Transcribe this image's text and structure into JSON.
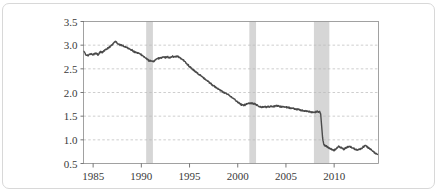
{
  "figure": {
    "border_color": "#d8d8d8",
    "background": "#ffffff"
  },
  "chart_data": {
    "type": "line",
    "title": "",
    "subtitle": "",
    "xlabel": "",
    "ylabel": "",
    "xlim": [
      1984.0,
      1984.0
    ],
    "ylim": [
      0.5,
      3.5
    ],
    "grid": true,
    "grid_style": "dashed-horizontal",
    "grid_color": "#b9b9b9",
    "legend": null,
    "line_color": "#4a4a4a",
    "line_width": 1.4,
    "axis_color": "#555555",
    "xticks": [
      1985,
      1990,
      1995,
      2000,
      2005,
      2010
    ],
    "xticklabels": [
      "1985",
      "1990",
      "1995",
      "2000",
      "2005",
      "2010"
    ],
    "yticks": [
      0.5,
      1.0,
      1.5,
      2.0,
      2.5,
      3.0,
      3.5
    ],
    "yticklabels": [
      "0.5",
      "1.0",
      "1.5",
      "2.0",
      "2.5",
      "3.0",
      "3.5"
    ],
    "x_axis_range": [
      1984.0,
      2014.6
    ],
    "shaded_regions": [
      {
        "name": "recession-1990",
        "x0": 1990.5,
        "x1": 1991.2,
        "color": "#d6d6d6"
      },
      {
        "name": "recession-2001",
        "x0": 2001.2,
        "x1": 2001.9,
        "color": "#d6d6d6"
      },
      {
        "name": "recession-2008",
        "x0": 2007.9,
        "x1": 2009.5,
        "color": "#d6d6d6"
      }
    ],
    "x": [
      1984.0,
      1984.25,
      1984.5,
      1984.75,
      1985.0,
      1985.25,
      1985.5,
      1985.75,
      1986.0,
      1986.25,
      1986.5,
      1986.75,
      1987.0,
      1987.25,
      1987.5,
      1987.75,
      1988.0,
      1988.25,
      1988.5,
      1988.75,
      1989.0,
      1989.25,
      1989.5,
      1989.75,
      1990.0,
      1990.25,
      1990.5,
      1990.75,
      1991.0,
      1991.25,
      1991.5,
      1991.75,
      1992.0,
      1992.25,
      1992.5,
      1992.75,
      1993.0,
      1993.25,
      1993.5,
      1993.75,
      1994.0,
      1994.25,
      1994.5,
      1994.75,
      1995.0,
      1995.25,
      1995.5,
      1995.75,
      1996.0,
      1996.25,
      1996.5,
      1996.75,
      1997.0,
      1997.25,
      1997.5,
      1997.75,
      1998.0,
      1998.25,
      1998.5,
      1998.75,
      1999.0,
      1999.25,
      1999.5,
      1999.75,
      2000.0,
      2000.25,
      2000.5,
      2000.75,
      2001.0,
      2001.25,
      2001.5,
      2001.75,
      2002.0,
      2002.25,
      2002.5,
      2002.75,
      2003.0,
      2003.25,
      2003.5,
      2003.75,
      2004.0,
      2004.25,
      2004.5,
      2004.75,
      2005.0,
      2005.25,
      2005.5,
      2005.75,
      2006.0,
      2006.25,
      2006.5,
      2006.75,
      2007.0,
      2007.25,
      2007.5,
      2007.75,
      2008.0,
      2008.25,
      2008.5,
      2008.6,
      2008.7,
      2008.8,
      2008.9,
      2009.0,
      2009.25,
      2009.5,
      2009.75,
      2010.0,
      2010.25,
      2010.5,
      2010.75,
      2011.0,
      2011.25,
      2011.5,
      2011.75,
      2012.0,
      2012.25,
      2012.5,
      2012.75,
      2013.0,
      2013.25,
      2013.5,
      2013.75,
      2014.0,
      2014.25,
      2014.5
    ],
    "y": [
      2.88,
      2.8,
      2.78,
      2.82,
      2.8,
      2.83,
      2.8,
      2.86,
      2.85,
      2.9,
      2.93,
      2.97,
      3.02,
      3.08,
      3.05,
      3.0,
      3.0,
      2.97,
      2.95,
      2.92,
      2.9,
      2.86,
      2.84,
      2.82,
      2.8,
      2.76,
      2.72,
      2.68,
      2.66,
      2.66,
      2.69,
      2.72,
      2.73,
      2.75,
      2.74,
      2.75,
      2.74,
      2.76,
      2.75,
      2.76,
      2.74,
      2.7,
      2.65,
      2.6,
      2.55,
      2.5,
      2.46,
      2.42,
      2.38,
      2.34,
      2.3,
      2.26,
      2.22,
      2.18,
      2.14,
      2.1,
      2.07,
      2.04,
      2.01,
      1.99,
      1.96,
      1.92,
      1.88,
      1.84,
      1.8,
      1.76,
      1.73,
      1.74,
      1.76,
      1.78,
      1.77,
      1.76,
      1.73,
      1.7,
      1.69,
      1.7,
      1.69,
      1.7,
      1.71,
      1.71,
      1.72,
      1.71,
      1.7,
      1.7,
      1.69,
      1.68,
      1.67,
      1.66,
      1.65,
      1.64,
      1.63,
      1.62,
      1.61,
      1.6,
      1.59,
      1.58,
      1.58,
      1.6,
      1.59,
      1.55,
      1.3,
      1.05,
      0.92,
      0.88,
      0.86,
      0.83,
      0.79,
      0.78,
      0.82,
      0.86,
      0.83,
      0.8,
      0.83,
      0.86,
      0.85,
      0.82,
      0.8,
      0.79,
      0.81,
      0.85,
      0.88,
      0.84,
      0.8,
      0.76,
      0.72,
      0.69
    ]
  }
}
